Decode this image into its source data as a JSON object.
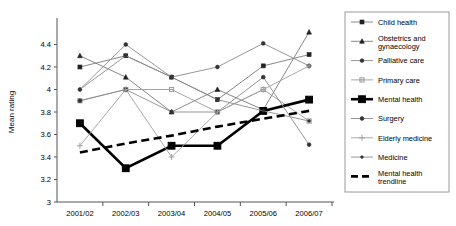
{
  "chart_data": {
    "type": "line",
    "title": "",
    "xlabel": "",
    "ylabel": "Mean rating",
    "categories": [
      "2001/02",
      "2002/03",
      "2003/04",
      "2004/05",
      "2005/06",
      "2006/07"
    ],
    "ylim": [
      3,
      4.6
    ],
    "yticks": [
      "3",
      "3.2",
      "3.4",
      "3.6",
      "3.8",
      "4",
      "4.2",
      "4.4"
    ],
    "ytick_values": [
      3,
      3.2,
      3.4,
      3.6,
      3.8,
      4.0,
      4.2,
      4.4
    ],
    "grid": false,
    "legend_position": "right",
    "series": [
      {
        "name": "Child health",
        "marker": "square",
        "color": "#7a7a7a",
        "style": "solid",
        "values": [
          4.2,
          4.3,
          4.11,
          3.91,
          4.21,
          4.31
        ]
      },
      {
        "name": "Obstetrics and gynaecology",
        "marker": "triangle",
        "color": "#7a7a7a",
        "style": "solid",
        "values": [
          4.3,
          4.11,
          3.8,
          4.0,
          3.82,
          4.51
        ]
      },
      {
        "name": "Palliative care",
        "marker": "circle",
        "color": "#8a8a8a",
        "style": "solid",
        "values": [
          4.0,
          4.4,
          4.11,
          4.2,
          4.41,
          4.21
        ]
      },
      {
        "name": "Primary care",
        "marker": "cross-square",
        "color": "#9a9a9a",
        "style": "solid",
        "values": [
          3.9,
          4.0,
          4.0,
          3.8,
          4.0,
          3.72
        ]
      },
      {
        "name": "Mental health",
        "marker": "square-bold",
        "color": "#000000",
        "style": "solid-bold",
        "values": [
          3.7,
          3.3,
          3.5,
          3.5,
          3.81,
          3.91
        ]
      },
      {
        "name": "Surgery",
        "marker": "circle",
        "color": "#8a8a8a",
        "style": "solid",
        "values": [
          3.9,
          4.0,
          3.8,
          3.8,
          4.11,
          3.51
        ]
      },
      {
        "name": "Elderly medicine",
        "marker": "plus",
        "color": "#a0a0a0",
        "style": "solid",
        "values": [
          3.5,
          4.0,
          3.4,
          3.8,
          4.0,
          4.21
        ]
      },
      {
        "name": "Medicine",
        "marker": "dot",
        "color": "#8a8a8a",
        "style": "solid",
        "values": [
          4.0,
          4.3,
          4.11,
          3.91,
          3.81,
          3.72
        ]
      },
      {
        "name": "Mental health trendline",
        "marker": "none",
        "color": "#000000",
        "style": "dashed-bold",
        "values": [
          3.44,
          3.52,
          3.59,
          3.67,
          3.74,
          3.81
        ]
      }
    ]
  },
  "legend": {
    "items": [
      {
        "label": "Child health"
      },
      {
        "label": "Obstetrics and gynaecology"
      },
      {
        "label": "Palliative care"
      },
      {
        "label": "Primary care"
      },
      {
        "label": "Mental health"
      },
      {
        "label": "Surgery"
      },
      {
        "label": "Elderly medicine"
      },
      {
        "label": "Medicine"
      },
      {
        "label": "Mental health trendline"
      }
    ]
  }
}
